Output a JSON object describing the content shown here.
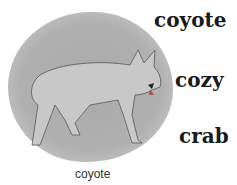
{
  "words": [
    "coyote",
    "cozy",
    "crab"
  ],
  "caption": "coyote",
  "illustration": "coyote-drawing"
}
